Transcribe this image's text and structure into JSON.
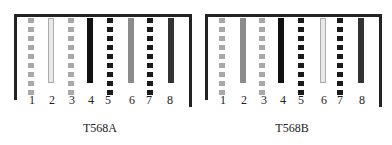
{
  "colors": {
    "frame": "#222222",
    "light_dash": "#a8a8a8",
    "light_outline_fill": "#e8e8e8",
    "light_outline_border": "#aaaaaa",
    "gray": "#8c8c8c",
    "black": "#111111",
    "dark": "#333333",
    "dark_dash": "#1a1a1a"
  },
  "diagrams": [
    {
      "caption": "T568A",
      "pins": [
        {
          "label": "1",
          "style": "dashed",
          "tone": "light_dash"
        },
        {
          "label": "2",
          "style": "outline",
          "tone": "light_outline"
        },
        {
          "label": "3",
          "style": "dashed",
          "tone": "light_dash"
        },
        {
          "label": "4",
          "style": "solid",
          "tone": "black"
        },
        {
          "label": "5",
          "style": "dashed",
          "tone": "dark_dash"
        },
        {
          "label": "6",
          "style": "solid",
          "tone": "gray"
        },
        {
          "label": "7",
          "style": "dashed",
          "tone": "dark_dash"
        },
        {
          "label": "8",
          "style": "solid",
          "tone": "dark"
        }
      ]
    },
    {
      "caption": "T568B",
      "pins": [
        {
          "label": "1",
          "style": "dashed",
          "tone": "light_dash"
        },
        {
          "label": "2",
          "style": "solid",
          "tone": "gray"
        },
        {
          "label": "3",
          "style": "dashed",
          "tone": "light_dash"
        },
        {
          "label": "4",
          "style": "solid",
          "tone": "black"
        },
        {
          "label": "5",
          "style": "dashed",
          "tone": "dark_dash"
        },
        {
          "label": "6",
          "style": "outline",
          "tone": "light_outline"
        },
        {
          "label": "7",
          "style": "dashed",
          "tone": "dark_dash"
        },
        {
          "label": "8",
          "style": "solid",
          "tone": "dark"
        }
      ]
    }
  ]
}
